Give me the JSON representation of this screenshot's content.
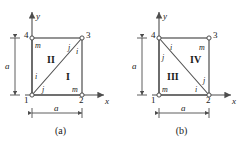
{
  "figure": {
    "type": "finite-element-mesh-diagram",
    "panels": [
      {
        "id": "a",
        "caption": "(a)",
        "axes": {
          "x_label": "x",
          "y_label": "y"
        },
        "dimensions": {
          "horizontal": "a",
          "vertical": "a"
        },
        "nodes": [
          {
            "id": "1",
            "label": "1",
            "x": 0,
            "y": 0
          },
          {
            "id": "2",
            "label": "2",
            "x": 1,
            "y": 0
          },
          {
            "id": "3",
            "label": "3",
            "x": 1,
            "y": 1
          },
          {
            "id": "4",
            "label": "4",
            "x": 0,
            "y": 1
          }
        ],
        "elements": [
          {
            "label": "I",
            "nodes": [
              "1",
              "2",
              "3"
            ]
          },
          {
            "label": "II",
            "nodes": [
              "1",
              "3",
              "4"
            ]
          }
        ],
        "diagonal": {
          "from": "1",
          "to": "3"
        },
        "local_labels": [
          {
            "text": "m",
            "for_node": "4",
            "element": "II"
          },
          {
            "text": "j",
            "for_node": "3",
            "element": "II"
          },
          {
            "text": "i",
            "for_node": "3",
            "element": "I"
          },
          {
            "text": "i",
            "for_node": "1",
            "element": "II"
          },
          {
            "text": "j",
            "for_node": "1",
            "element": "I"
          },
          {
            "text": "m",
            "for_node": "2",
            "element": "I"
          }
        ]
      },
      {
        "id": "b",
        "caption": "(b)",
        "axes": {
          "x_label": "x",
          "y_label": "y"
        },
        "dimensions": {
          "horizontal": "a",
          "vertical": "a"
        },
        "nodes": [
          {
            "id": "1",
            "label": "1",
            "x": 0,
            "y": 0
          },
          {
            "id": "2",
            "label": "2",
            "x": 1,
            "y": 0
          },
          {
            "id": "3",
            "label": "3",
            "x": 1,
            "y": 1
          },
          {
            "id": "4",
            "label": "4",
            "x": 0,
            "y": 1
          }
        ],
        "elements": [
          {
            "label": "III",
            "nodes": [
              "1",
              "2",
              "4"
            ]
          },
          {
            "label": "IV",
            "nodes": [
              "2",
              "3",
              "4"
            ]
          }
        ],
        "diagonal": {
          "from": "4",
          "to": "2"
        },
        "local_labels": [
          {
            "text": "i",
            "for_node": "4",
            "element": "IV"
          },
          {
            "text": "j",
            "for_node": "4",
            "element": "III"
          },
          {
            "text": "m",
            "for_node": "3",
            "element": "IV"
          },
          {
            "text": "m",
            "for_node": "1",
            "element": "III"
          },
          {
            "text": "j",
            "for_node": "2",
            "element": "IV"
          },
          {
            "text": "i",
            "for_node": "2",
            "element": "III"
          }
        ]
      }
    ],
    "colors": {
      "line": "#4d4d4d",
      "text": "#1a1a1a",
      "background": "#ffffff"
    }
  }
}
